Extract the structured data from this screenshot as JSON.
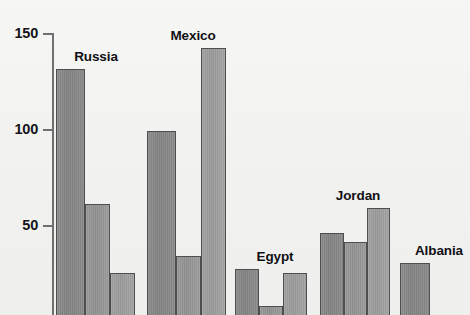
{
  "chart_data": {
    "type": "bar",
    "title": "",
    "subtitle": "",
    "xlabel": "",
    "ylabel": "",
    "ylim": [
      0,
      150
    ],
    "grid": false,
    "legend": "none",
    "note": "Cropped grouped bar chart; baseline (0) falls below the visible image edge, so bars are cut off at the bottom.",
    "axis": {
      "ticks": [
        {
          "label": "150",
          "value": 150
        },
        {
          "label": "100",
          "value": 100
        },
        {
          "label": "50",
          "value": 50
        }
      ]
    },
    "categories": [
      "Russia",
      "Mexico",
      "Egypt",
      "Jordan",
      "Albania"
    ],
    "series": [
      {
        "name": "bar-1",
        "values": [
          131,
          99,
          27,
          46,
          30
        ]
      },
      {
        "name": "bar-2",
        "values": [
          61,
          34,
          8,
          41,
          3
        ]
      },
      {
        "name": "bar-3",
        "values": [
          25,
          142,
          25,
          59,
          null
        ]
      }
    ],
    "groups": [
      {
        "label": "Russia",
        "label_x": 96,
        "bars": [
          {
            "x": 56,
            "width": 29,
            "value": 131,
            "tone": 0
          },
          {
            "x": 85,
            "width": 25,
            "value": 61,
            "tone": 1
          },
          {
            "x": 110,
            "width": 25,
            "value": 25,
            "tone": 2
          }
        ]
      },
      {
        "label": "Mexico",
        "label_x": 193,
        "bars": [
          {
            "x": 147,
            "width": 29,
            "value": 99,
            "tone": 0
          },
          {
            "x": 176,
            "width": 25,
            "value": 34,
            "tone": 1
          },
          {
            "x": 201,
            "width": 25,
            "value": 142,
            "tone": 2
          }
        ]
      },
      {
        "label": "Egypt",
        "label_x": 275,
        "bars": [
          {
            "x": 235,
            "width": 24,
            "value": 27,
            "tone": 0
          },
          {
            "x": 259,
            "width": 24,
            "value": 8,
            "tone": 1
          },
          {
            "x": 283,
            "width": 24,
            "value": 25,
            "tone": 2
          }
        ]
      },
      {
        "label": "Jordan",
        "label_x": 358,
        "bars": [
          {
            "x": 320,
            "width": 24,
            "value": 46,
            "tone": 0
          },
          {
            "x": 344,
            "width": 23,
            "value": 41,
            "tone": 1
          },
          {
            "x": 367,
            "width": 23,
            "value": 59,
            "tone": 2
          }
        ]
      },
      {
        "label": "Albania",
        "label_x": 439,
        "bars": [
          {
            "x": 400,
            "width": 30,
            "value": 30,
            "tone": 0
          },
          {
            "x": 457,
            "width": 30,
            "value": 3,
            "tone": 2
          }
        ]
      }
    ]
  },
  "colors": {
    "background": "#f4f4f2",
    "bar_fill": "#8d8d8d",
    "bar_edge": "#4e4e4e",
    "axis": "#6f6f6f",
    "text": "#15151a"
  }
}
